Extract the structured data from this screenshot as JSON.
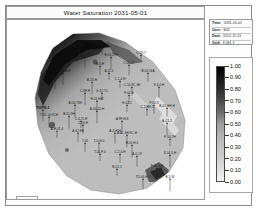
{
  "title": {
    "text": "Water Saturation 2031-05-01"
  },
  "info_box": {
    "rows": [
      {
        "key": "Time:",
        "value": "2031-05-01"
      },
      {
        "key": "User:",
        "value": "S03"
      },
      {
        "key": "Date:",
        "value": "2012-11-13"
      },
      {
        "key": "Grid:",
        "value": "3 081 1"
      }
    ]
  },
  "colorbar": {
    "title": "",
    "min": 0.0,
    "max": 1.0,
    "labels": [
      "1.00",
      "0.90",
      "0.80",
      "0.70",
      "0.60",
      "0.50",
      "0.40",
      "0.30",
      "0.20",
      "0.10",
      "0.00"
    ],
    "values": [
      1.0,
      0.9,
      0.8,
      0.7,
      0.6,
      0.5,
      0.4,
      0.3,
      0.2,
      0.1,
      0.0
    ],
    "colors_top_to_bottom": [
      "#000000",
      "#161616",
      "#2d2d2d",
      "#4a4a4a",
      "#6e6e6e",
      "#9d9d9d",
      "#b4b4b4",
      "#c2c2c2",
      "#cfcfcf",
      "#e0e0e0",
      "#f2f2f2"
    ]
  },
  "north_arrow": {
    "name": "north-arrow",
    "label": "N"
  },
  "map": {
    "background": "#ffffff",
    "grid_fill_light": "#b9b9b9",
    "grid_fill_mid": "#a8a8a8",
    "grid_fill_dark": "#2a2a2a",
    "outline": "#8f8f8f",
    "wells": [
      {
        "label": "A-11-H",
        "x": 72,
        "y": 27
      },
      {
        "label": "B-204-33",
        "x": 95,
        "y": 25
      },
      {
        "label": "B-04-17H",
        "x": 78,
        "y": 36
      },
      {
        "label": "B-04-19H",
        "x": 104,
        "y": 36
      },
      {
        "label": "C-29-7",
        "x": 134,
        "y": 34
      },
      {
        "label": "B-3-H",
        "x": 93,
        "y": 45
      },
      {
        "label": "C-06-1T",
        "x": 122,
        "y": 44
      },
      {
        "label": "C-3-A-A-H",
        "x": 56,
        "y": 52
      },
      {
        "label": "A-11-5",
        "x": 102,
        "y": 52
      },
      {
        "label": "B-04-16A",
        "x": 141,
        "y": 52
      },
      {
        "label": "B-H",
        "x": 48,
        "y": 58
      },
      {
        "label": "B-25-H",
        "x": 85,
        "y": 61
      },
      {
        "label": "C-1-4-H",
        "x": 113,
        "y": 60
      },
      {
        "label": "C-10-9C-4H",
        "x": 125,
        "y": 66
      },
      {
        "label": "F-3-4-H",
        "x": 152,
        "y": 66
      },
      {
        "label": "C-8F-H",
        "x": 78,
        "y": 72
      },
      {
        "label": "G-21-7C",
        "x": 95,
        "y": 72
      },
      {
        "label": "F-04-H",
        "x": 122,
        "y": 74
      },
      {
        "label": "H-01-HW",
        "x": 90,
        "y": 80
      },
      {
        "label": "A-04-74H",
        "x": 68,
        "y": 84
      },
      {
        "label": "E-02-2",
        "x": 120,
        "y": 84
      },
      {
        "label": "F-04-3",
        "x": 147,
        "y": 84
      },
      {
        "label": "TOPS-1",
        "x": 36,
        "y": 89,
        "bold": true
      },
      {
        "label": "A-04-14-H",
        "x": 90,
        "y": 90
      },
      {
        "label": "C-1-HH-1",
        "x": 140,
        "y": 88
      },
      {
        "label": "B-01-HH-H",
        "x": 160,
        "y": 87
      },
      {
        "label": "T-01-16-9CH",
        "x": 42,
        "y": 96
      },
      {
        "label": "B-01-9H",
        "x": 62,
        "y": 95
      },
      {
        "label": "C-4-21-H",
        "x": 74,
        "y": 100
      },
      {
        "label": "C-06-H",
        "x": 76,
        "y": 104
      },
      {
        "label": "A-9F-H-8",
        "x": 115,
        "y": 100
      },
      {
        "label": "A-C1-5",
        "x": 160,
        "y": 102
      },
      {
        "label": "A-H-01-4",
        "x": 50,
        "y": 110
      },
      {
        "label": "A-02-8H",
        "x": 71,
        "y": 112
      },
      {
        "label": "A-4-H-H",
        "x": 108,
        "y": 112
      },
      {
        "label": "A-AL-6H-9C-H",
        "x": 120,
        "y": 114
      },
      {
        "label": "F-04-7H",
        "x": 163,
        "y": 118
      },
      {
        "label": "T-03",
        "x": 78,
        "y": 122
      },
      {
        "label": "T-0-H-0",
        "x": 92,
        "y": 122
      },
      {
        "label": "B-01-H-5",
        "x": 125,
        "y": 124
      },
      {
        "label": "T-01-F-0",
        "x": 93,
        "y": 133
      },
      {
        "label": "C-2-4-H",
        "x": 113,
        "y": 133
      },
      {
        "label": "A-0-19",
        "x": 130,
        "y": 135
      },
      {
        "label": "X-04-5-H",
        "x": 163,
        "y": 134
      },
      {
        "label": "B-01-1",
        "x": 110,
        "y": 148
      },
      {
        "label": "F-01-9-H",
        "x": 150,
        "y": 147
      },
      {
        "label": "TD-04-H-2",
        "x": 136,
        "y": 158
      },
      {
        "label": "B-5-W",
        "x": 163,
        "y": 158
      }
    ]
  }
}
